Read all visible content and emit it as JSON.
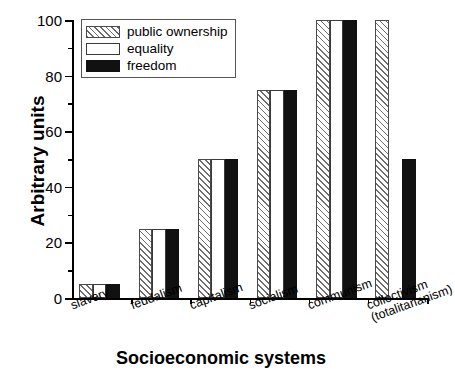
{
  "chart_data": {
    "type": "bar",
    "title": "",
    "xlabel": "Socioeconomic systems",
    "ylabel": "Arbitrary units",
    "ylim": [
      0,
      100
    ],
    "yticks": [
      0,
      20,
      40,
      60,
      80,
      100
    ],
    "yminorticks": [
      10,
      30,
      50,
      70,
      90
    ],
    "grid": false,
    "legend_position": "top-left",
    "categories": [
      "slavery",
      "feudalism",
      "capitalism",
      "socialism",
      "communism",
      "collectivism\n(totalitarianism)"
    ],
    "series": [
      {
        "name": "public ownership",
        "pattern": "hatched",
        "color": "#ffffff",
        "values": [
          5,
          25,
          50,
          75,
          100,
          100
        ]
      },
      {
        "name": "equality",
        "pattern": "open",
        "color": "#ffffff",
        "values": [
          5,
          25,
          50,
          75,
          100,
          0
        ]
      },
      {
        "name": "freedom",
        "pattern": "solid",
        "color": "#111111",
        "values": [
          5,
          25,
          50,
          75,
          100,
          50
        ]
      }
    ]
  },
  "legend": {
    "entries": [
      {
        "label": "public ownership"
      },
      {
        "label": "equality"
      },
      {
        "label": "freedom"
      }
    ]
  }
}
